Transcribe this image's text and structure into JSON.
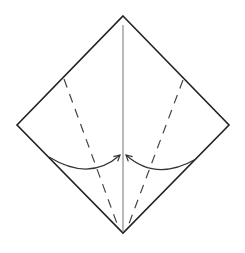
{
  "diagram": {
    "type": "origami-fold-step",
    "colors": {
      "background": "#ffffff",
      "outline": "#222222",
      "center_crease": "#8a8a8a",
      "valley_fold": "#444444",
      "arrow": "#333333"
    },
    "paper": {
      "top": [
        123,
        16
      ],
      "right": [
        229,
        125
      ],
      "bottom": [
        123,
        233
      ],
      "left": [
        17,
        125
      ]
    },
    "center_crease": {
      "from": [
        123,
        25
      ],
      "to": [
        123,
        231
      ]
    },
    "valley_folds": [
      {
        "side": "left",
        "from": [
          64,
          79
        ],
        "to": [
          119,
          229
        ]
      },
      {
        "side": "right",
        "from": [
          183,
          80
        ],
        "to": [
          127,
          229
        ]
      }
    ],
    "arrows": [
      {
        "side": "left",
        "from": [
          49,
          157
        ],
        "control": [
          90,
          182
        ],
        "to": [
          120,
          155
        ]
      },
      {
        "side": "right",
        "from": [
          196,
          159
        ],
        "control": [
          156,
          182
        ],
        "to": [
          126,
          155
        ]
      }
    ]
  }
}
